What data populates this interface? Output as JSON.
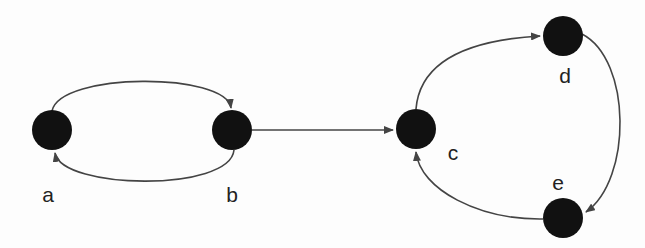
{
  "diagram": {
    "type": "directed-graph",
    "colors": {
      "background": "#fdfdfd",
      "node_fill": "#111111",
      "edge_stroke": "#444444",
      "label_color": "#222222"
    },
    "node_radius": 20,
    "nodes": [
      {
        "id": "a",
        "label": "a",
        "cx": 52,
        "cy": 130,
        "label_x": 48,
        "label_y": 202
      },
      {
        "id": "b",
        "label": "b",
        "cx": 232,
        "cy": 130,
        "label_x": 232,
        "label_y": 202
      },
      {
        "id": "c",
        "label": "c",
        "cx": 416,
        "cy": 129,
        "label_x": 453,
        "label_y": 160
      },
      {
        "id": "d",
        "label": "d",
        "cx": 563,
        "cy": 36,
        "label_x": 565,
        "label_y": 83
      },
      {
        "id": "e",
        "label": "e",
        "cx": 563,
        "cy": 218,
        "label_x": 558,
        "label_y": 190
      }
    ],
    "edges": [
      {
        "id": "a-b",
        "from": "a",
        "to": "b",
        "path": "M 52 111 C 60 72, 226 72, 231 108"
      },
      {
        "id": "b-a",
        "from": "b",
        "to": "a",
        "path": "M 234 150 C 230 192, 62 190, 55 153"
      },
      {
        "id": "b-c",
        "from": "b",
        "to": "c",
        "path": "M 252 130 L 393 130"
      },
      {
        "id": "c-d",
        "from": "c",
        "to": "d",
        "path": "M 416 109 C 420 60, 470 40, 540 36"
      },
      {
        "id": "d-e",
        "from": "d",
        "to": "e",
        "path": "M 582 34 C 632 60, 632 180, 586 212"
      },
      {
        "id": "e-c",
        "from": "e",
        "to": "c",
        "path": "M 543 219 C 480 220, 420 190, 416 152"
      }
    ]
  }
}
